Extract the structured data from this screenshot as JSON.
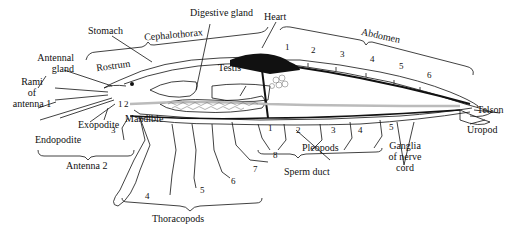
{
  "diagram": {
    "labels": {
      "stomach": "Stomach",
      "cephalothorax": "Cephalothorax",
      "digestive_gland": "Digestive gland",
      "heart": "Heart",
      "abdomen": "Abdomen",
      "rostrum": "Rostrum",
      "antennal_gland_1": "Antennal",
      "antennal_gland_2": "gland",
      "testis": "Testis",
      "rami_1": "Rami",
      "rami_2": "of",
      "rami_3": "antenna 1",
      "mandible": "Mandible",
      "exopodite": "Exopodite",
      "endopodite": "Endopodite",
      "antenna2": "Antenna 2",
      "telson": "Telson",
      "uropod": "Uropod",
      "pleopods": "Pleopods",
      "sperm_duct": "Sperm duct",
      "ganglia_1": "Ganglia",
      "ganglia_2": "of nerve",
      "ganglia_3": "cord",
      "thoracopods": "Thoracopods"
    },
    "abdomen_segments": [
      "1",
      "2",
      "3",
      "4",
      "5",
      "6"
    ],
    "pleopod_numbers": [
      "1",
      "2",
      "3",
      "4",
      "5"
    ],
    "thoracopod_numbers": [
      "1",
      "2",
      "3",
      "4",
      "5",
      "6",
      "7",
      "8"
    ],
    "colors": {
      "ink": "#111111",
      "background": "#ffffff",
      "shade": "#bbbbbb"
    }
  }
}
